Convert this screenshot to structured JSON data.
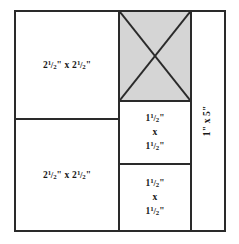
{
  "diagram": {
    "type": "quilt-block-cutting-diagram",
    "frame_color": "#2a2a2a",
    "shaded_fill_color": "#d5d5d5",
    "background_color": "#ffffff",
    "cells": [
      {
        "id": "left-top",
        "position": "left column, top",
        "label_whole": "2",
        "label_num": "1",
        "label_slash": "/",
        "label_den": "2",
        "label_unit": "\"",
        "label_times": " x ",
        "label_whole2": "2",
        "label_num2": "1",
        "label_den2": "2",
        "label_unit2": "\"",
        "label_plain": "2 1/2\" x 2 1/2\"",
        "shaded": false,
        "diagonals": false
      },
      {
        "id": "left-bottom",
        "position": "left column, bottom",
        "label_plain": "2 1/2\" x 2 1/2\"",
        "shaded": false,
        "diagonals": false
      },
      {
        "id": "mid-top",
        "position": "middle column, top",
        "label_plain": "",
        "shaded": true,
        "diagonals": true
      },
      {
        "id": "mid-middle",
        "position": "middle column, middle",
        "label_plain": "1 1/2\" x 1 1/2\"",
        "shaded": false,
        "diagonals": false
      },
      {
        "id": "mid-bottom",
        "position": "middle column, bottom",
        "label_plain": "1 1/2\" x 1 1/2\"",
        "shaded": false,
        "diagonals": false
      },
      {
        "id": "right",
        "position": "right column, full height",
        "label_plain": "1\" x 5\"",
        "rotated": true,
        "shaded": false,
        "diagonals": false
      }
    ]
  },
  "labels": {
    "left_top": {
      "whole_a": "2",
      "num_a": "1",
      "slash_a": "/",
      "den_a": "2",
      "unit_a": "\"",
      "times": "x",
      "whole_b": "2",
      "num_b": "1",
      "slash_b": "/",
      "den_b": "2",
      "unit_b": "\""
    },
    "left_bottom": {
      "whole_a": "2",
      "num_a": "1",
      "slash_a": "/",
      "den_a": "2",
      "unit_a": "\"",
      "times": "x",
      "whole_b": "2",
      "num_b": "1",
      "slash_b": "/",
      "den_b": "2",
      "unit_b": "\""
    },
    "mid_middle": {
      "line1_whole": "1",
      "line1_num": "1",
      "line1_slash": "/",
      "line1_den": "2",
      "line1_unit": "\"",
      "line2": "x",
      "line3_whole": "1",
      "line3_num": "1",
      "line3_slash": "/",
      "line3_den": "2",
      "line3_unit": "\""
    },
    "mid_bottom": {
      "line1_whole": "1",
      "line1_num": "1",
      "line1_slash": "/",
      "line1_den": "2",
      "line1_unit": "\"",
      "line2": "x",
      "line3_whole": "1",
      "line3_num": "1",
      "line3_slash": "/",
      "line3_den": "2",
      "line3_unit": "\""
    },
    "right": {
      "text": "1\" x 5\""
    }
  }
}
